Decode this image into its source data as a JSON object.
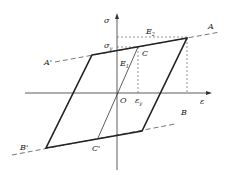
{
  "diagram": {
    "type": "bilinear hysteresis stress-strain diagram",
    "axes": {
      "x_label": "ε",
      "y_label": "σ",
      "origin_label": "O"
    },
    "points": {
      "A": "A",
      "A_prime": "A'",
      "B": "B",
      "B_prime": "B'",
      "C": "C",
      "C_prime": "C'"
    },
    "annotations": {
      "sigma_y": "σ",
      "sigma_y_sub": "y",
      "epsilon_y": "ε",
      "epsilon_y_sub": "y",
      "E1": "E",
      "E1_sub": "1",
      "E2": "E",
      "E2_sub": "2"
    },
    "colors": {
      "line": "#222222",
      "dashed": "#555555"
    }
  }
}
